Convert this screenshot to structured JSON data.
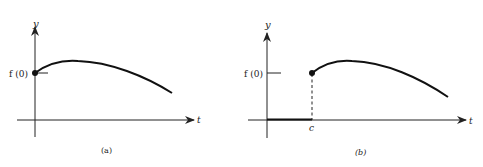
{
  "figure": {
    "panels": [
      {
        "id": "a",
        "caption": "(a)",
        "y_axis_label": "y",
        "x_axis_label": "t",
        "y_tick_label": "f (0)",
        "description": "Continuous function starting at f(0) at t=0, rising to a maximum, then decreasing"
      },
      {
        "id": "b",
        "caption": "(b)",
        "y_axis_label": "y",
        "x_axis_label": "t",
        "y_tick_label": "f (0)",
        "x_tick_label": "c",
        "description": "Function equal to zero for t < c, then jumps to f(0) at t=c and follows the shifted curve"
      }
    ]
  },
  "colors": {
    "ink": "#222222",
    "background": "#ffffff"
  }
}
